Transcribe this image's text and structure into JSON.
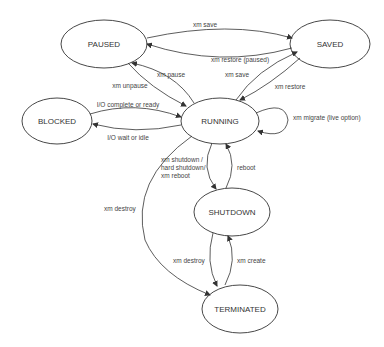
{
  "diagram": {
    "type": "state-machine",
    "colors": {
      "stroke": "#333333",
      "text": "#333333",
      "background": "#ffffff"
    },
    "nodes": [
      {
        "id": "paused",
        "label": "PAUSED",
        "cx": 104,
        "cy": 44,
        "rx": 43,
        "ry": 24
      },
      {
        "id": "saved",
        "label": "SAVED",
        "cx": 330,
        "cy": 44,
        "rx": 40,
        "ry": 24
      },
      {
        "id": "blocked",
        "label": "BLOCKED",
        "cx": 57,
        "cy": 121,
        "rx": 35,
        "ry": 23
      },
      {
        "id": "running",
        "label": "RUNNING",
        "cx": 220,
        "cy": 121,
        "rx": 39,
        "ry": 23
      },
      {
        "id": "shutdown",
        "label": "SHUTDOWN",
        "cx": 232,
        "cy": 212,
        "rx": 38,
        "ry": 24
      },
      {
        "id": "terminated",
        "label": "TERMINATED",
        "cx": 240,
        "cy": 309,
        "rx": 38,
        "ry": 24
      }
    ],
    "edges": [
      {
        "from": "paused",
        "to": "saved",
        "label": "xm save"
      },
      {
        "from": "saved",
        "to": "paused",
        "label": "xm restore (paused)"
      },
      {
        "from": "paused",
        "to": "running",
        "label": "xm unpause"
      },
      {
        "from": "running",
        "to": "paused",
        "label": "xm pause"
      },
      {
        "from": "running",
        "to": "saved",
        "label": "xm save"
      },
      {
        "from": "saved",
        "to": "running",
        "label": "xm restore"
      },
      {
        "from": "running",
        "to": "running",
        "label": "xm migrate (live option)"
      },
      {
        "from": "blocked",
        "to": "running",
        "label": "I/O complete or ready"
      },
      {
        "from": "running",
        "to": "blocked",
        "label": "I/O wait or idle"
      },
      {
        "from": "running",
        "to": "shutdown",
        "label": "xm shutdown / hard shutdown/ xm reboot",
        "label_lines": [
          "xm shutdown /",
          "hard shutdown/",
          "xm reboot"
        ]
      },
      {
        "from": "shutdown",
        "to": "running",
        "label": "reboot"
      },
      {
        "from": "running",
        "to": "terminated",
        "label": "xm destroy"
      },
      {
        "from": "shutdown",
        "to": "terminated",
        "label": "xm destroy"
      },
      {
        "from": "terminated",
        "to": "shutdown",
        "label": "xm create"
      }
    ]
  }
}
